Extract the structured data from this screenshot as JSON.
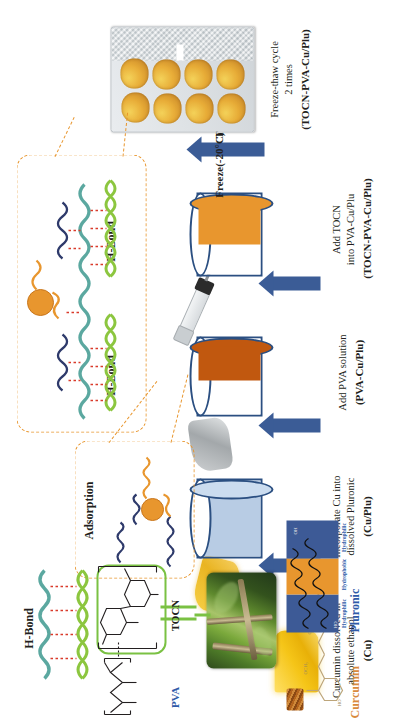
{
  "figure": {
    "type": "scientific-process-schematic",
    "orientation": "rotated-90-ccw",
    "title_present": false
  },
  "process": {
    "steps": [
      {
        "id": "step-cu",
        "caption_lines": [
          "Curcumin dissolved  in",
          "absolute ethanol"
        ],
        "product": "(Cu)"
      },
      {
        "id": "step-cu-plu",
        "caption_lines": [
          "Incorporate Cu into",
          "dissolved Pluronic"
        ],
        "product": "(Cu/Plu)"
      },
      {
        "id": "step-pva-cu-plu",
        "caption_lines": [
          "Add PVA solution"
        ],
        "product": "(PVA-Cu/Plu)"
      },
      {
        "id": "step-tocn-pva-cu-plu",
        "caption_lines": [
          "Add TOCN",
          "into PVA-Cu/Plu"
        ],
        "product": "(TOCN-PVA-Cu/Plu)"
      },
      {
        "id": "step-freeze-thaw",
        "caption_lines": [
          "Freeze-thaw cycle",
          "2 times"
        ],
        "product": "(TOCN-PVA-Cu/Plu)"
      }
    ],
    "freeze_label": "Freeze(-20°C)",
    "thaw_label": "Thaw (37°C)"
  },
  "insets": {
    "adsorption": {
      "label": "Adsorption"
    },
    "hbond_detail": {
      "label_left": "H-Bond",
      "label_right": "H-Bond"
    },
    "hbond_top": {
      "label": "H-Bond"
    }
  },
  "molecules": {
    "curcumin": {
      "label": "Curcumin",
      "color": "#d98a3c"
    },
    "pluronic": {
      "label": "Pluronic",
      "color": "#2e5aa8",
      "segments": [
        "Hydrophilic",
        "Hydrophobic",
        "Hydrophilic"
      ]
    },
    "pva": {
      "label": "PVA",
      "color": "#2e5aa8"
    },
    "tocn": {
      "label": "TOCN",
      "color": "#231f20"
    }
  },
  "colors": {
    "arrow_blue": "#3b5c96",
    "vessel_outline": "#2b4f81",
    "cu_plu_fill": "#b8cce4",
    "pva_fill": "#c1580f",
    "tocn_fill": "#e8962e",
    "dashed_orange": "#e8962e",
    "green_bracket": "#7ac143",
    "chain_green": "#8cc63f",
    "chain_teal": "#5ba8a0",
    "chain_navy": "#2e3a6b",
    "chain_orange": "#e8962e",
    "hbond_red": "#d93b2b"
  },
  "photos": {
    "bamboo": {
      "name": "bamboo-source-photo"
    },
    "well_plate": {
      "name": "well-plate-hydrogel-photo",
      "well_count": 8
    },
    "curcumin_beaker": {
      "name": "curcumin-ethanol-beaker-photo"
    },
    "pluronic_pour": {
      "name": "pluronic-pour-photo"
    },
    "pva_pour": {
      "name": "pva-pour-photo"
    },
    "tocn_syringe": {
      "name": "tocn-syringe-photo"
    }
  }
}
